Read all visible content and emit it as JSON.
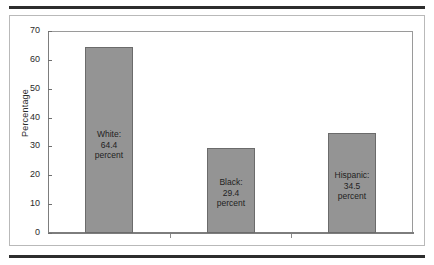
{
  "figure": {
    "bar_fill_color": "#949494",
    "bar_border_color": "#6b6b6b",
    "frame_color": "#9a9a9a",
    "rule_color": "#2d2d2d"
  },
  "chart_data": {
    "type": "bar",
    "title": "",
    "xlabel": "",
    "ylabel": "Percentage",
    "ylim": [
      0,
      70
    ],
    "yticks": [
      0,
      10,
      20,
      30,
      40,
      50,
      60,
      70
    ],
    "ytick_labels": [
      "0",
      "10",
      "20",
      "30",
      "40",
      "50",
      "60",
      "70"
    ],
    "grid": false,
    "legend": "none",
    "categories": [
      "White",
      "Black",
      "Hispanic"
    ],
    "values": [
      64.4,
      29.4,
      34.5
    ],
    "xtick_labels": [
      "",
      "",
      ""
    ],
    "bar_labels": [
      {
        "line1": "White:",
        "line2": "64.4",
        "line3": "percent"
      },
      {
        "line1": "Black:",
        "line2": "29.4",
        "line3": "percent"
      },
      {
        "line1": "Hispanic:",
        "line2": "34.5",
        "line3": "percent"
      }
    ]
  }
}
